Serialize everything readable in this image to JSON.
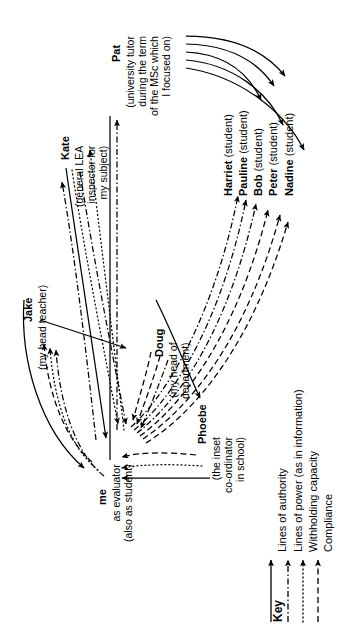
{
  "diagram": {
    "title_present": false,
    "orientation": "text rotated 90 degrees counter-clockwise (read bottom-to-top)",
    "nodes": [
      {
        "id": "pat",
        "name": "Pat",
        "descriptor": "(university tutor during the term of the MSc which I focused on)",
        "descriptor_lines": [
          "(university tutor",
          "during the term",
          "of the MSc which",
          "I focused on)"
        ]
      },
      {
        "id": "kate",
        "name": "Kate",
        "descriptor": "(general LEA inspector for my subject)",
        "descriptor_lines": [
          "(general LEA",
          "inspector for",
          "my subject)"
        ]
      },
      {
        "id": "jake",
        "name": "Jake",
        "descriptor": "(my head teacher)",
        "descriptor_lines": [
          "(my head teacher)"
        ]
      },
      {
        "id": "doug",
        "name": "Doug",
        "descriptor": "(my head of department)",
        "descriptor_lines": [
          "(my head of",
          "department)"
        ]
      },
      {
        "id": "phoebe",
        "name": "Phoebe",
        "descriptor": "(the inset co-ordinator in school)",
        "descriptor_lines": [
          "(the inset",
          "co-ordinator",
          "in school)"
        ]
      },
      {
        "id": "me",
        "name": "me",
        "descriptor": "as evaluator (also as student)",
        "descriptor_lines": [
          "as evaluator",
          "(also as student)"
        ]
      },
      {
        "id": "harriet",
        "name": "Harriet",
        "descriptor": "(student)"
      },
      {
        "id": "pauline",
        "name": "Pauline",
        "descriptor": "(student)"
      },
      {
        "id": "bob",
        "name": "Bob",
        "descriptor": "(student)"
      },
      {
        "id": "peter",
        "name": "Peter",
        "descriptor": "(student)"
      },
      {
        "id": "nadine",
        "name": "Nadine",
        "descriptor": "(student)"
      }
    ],
    "key": {
      "heading": "Key",
      "entries": [
        {
          "label": "Lines of authority",
          "style": "solid"
        },
        {
          "label": "Lines of power (as in information)",
          "style": "dash-dot"
        },
        {
          "label": "Withholding capacity",
          "style": "dotted"
        },
        {
          "label": "Compliance",
          "style": "dashed"
        }
      ]
    },
    "colors": {
      "ink": "#000000",
      "background": "#ffffff"
    }
  }
}
